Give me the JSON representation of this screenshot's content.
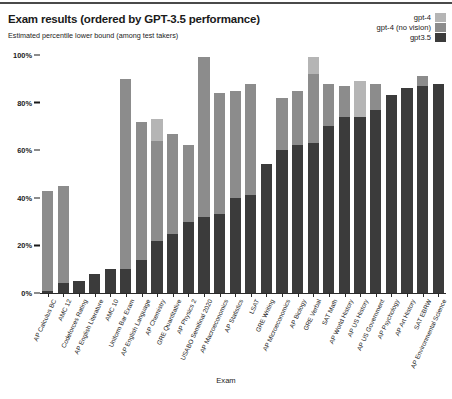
{
  "header": {
    "title": "Exam results (ordered by GPT-3.5 performance)",
    "subtitle": "Estimated percentile lower bound (among test takers)"
  },
  "legend": {
    "position": "top-right",
    "entries": [
      {
        "label": "gpt-4",
        "color": "#b5b5b5"
      },
      {
        "label": "gpt-4 (no vision)",
        "color": "#8c8c8c"
      },
      {
        "label": "gpt3.5",
        "color": "#3b3b3b"
      }
    ]
  },
  "axes": {
    "x_title": "Exam",
    "y_ticks": [
      "100%",
      "80%",
      "60%",
      "40%",
      "20%",
      "0%"
    ]
  },
  "chart_data": {
    "type": "bar",
    "title": "Exam results (ordered by GPT-3.5 performance)",
    "subtitle": "Estimated percentile lower bound (among test takers)",
    "xlabel": "Exam",
    "ylabel": "Estimated percentile lower bound (among test takers)",
    "ylim": [
      0,
      100
    ],
    "ytick_labels": [
      "0%",
      "20%",
      "40%",
      "60%",
      "80%",
      "100%"
    ],
    "ytick_values": [
      0,
      20,
      40,
      60,
      80,
      100
    ],
    "grid": false,
    "stacked": true,
    "stack_note": "Bars are overlaid totals: each series value is the total percentile for that model; segments render the incremental difference.",
    "legend_position": "top right",
    "categories": [
      "AP Calculus BC",
      "AMC 12",
      "Codeforces Rating",
      "AP English Literature",
      "AMC 10",
      "Uniform Bar Exam",
      "AP English Language",
      "AP Chemistry",
      "GRE Quantitative",
      "AP Physics 2",
      "USABO Semifinal 2020",
      "AP Macroeconomics",
      "AP Statistics",
      "LSAT",
      "GRE Writing",
      "AP Microeconomics",
      "AP Biology",
      "GRE Verbal",
      "SAT Math",
      "AP World History",
      "AP US History",
      "AP US Government",
      "AP Psychology",
      "AP Art History",
      "SAT EBRW",
      "AP Environmental Science"
    ],
    "series": [
      {
        "name": "gpt3.5",
        "color": "#3b3b3b",
        "values": [
          1,
          4,
          5,
          8,
          10,
          10,
          14,
          22,
          25,
          30,
          32,
          33,
          40,
          41,
          54,
          60,
          62,
          63,
          70,
          74,
          74,
          77,
          83,
          86,
          87,
          88
        ]
      },
      {
        "name": "gpt-4 (no vision)",
        "color": "#8c8c8c",
        "values": [
          43,
          45,
          5,
          8,
          10,
          90,
          72,
          64,
          67,
          62,
          99,
          84,
          85,
          88,
          54,
          82,
          85,
          92,
          88,
          87,
          74,
          88,
          83,
          86,
          91,
          88
        ]
      },
      {
        "name": "gpt-4",
        "color": "#b5b5b5",
        "values": [
          43,
          45,
          5,
          8,
          10,
          90,
          72,
          73,
          67,
          62,
          99,
          84,
          85,
          88,
          54,
          82,
          85,
          99,
          88,
          87,
          89,
          88,
          83,
          86,
          91,
          88
        ]
      }
    ]
  }
}
